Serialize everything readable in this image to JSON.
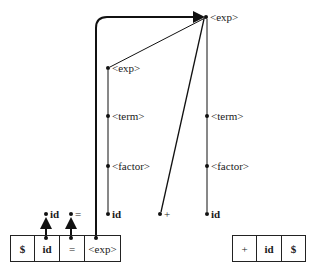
{
  "diagram": {
    "type": "shift-reduce parse tree",
    "tree_nodes": {
      "root_exp": "<exp>",
      "left_exp": "<exp>",
      "left_term": "<term>",
      "left_factor": "<factor>",
      "left_id": "id",
      "plus": "+",
      "right_term": "<term>",
      "right_factor": "<factor>",
      "right_id": "id"
    },
    "shifted_tokens": {
      "id": "id",
      "equals": "="
    },
    "stack": {
      "cells": [
        "$",
        "id",
        "=",
        "<exp>"
      ]
    },
    "input": {
      "cells": [
        "+",
        "id",
        "$"
      ]
    },
    "colors": {
      "line": "#1a1a1a",
      "background": "#ffffff"
    }
  }
}
